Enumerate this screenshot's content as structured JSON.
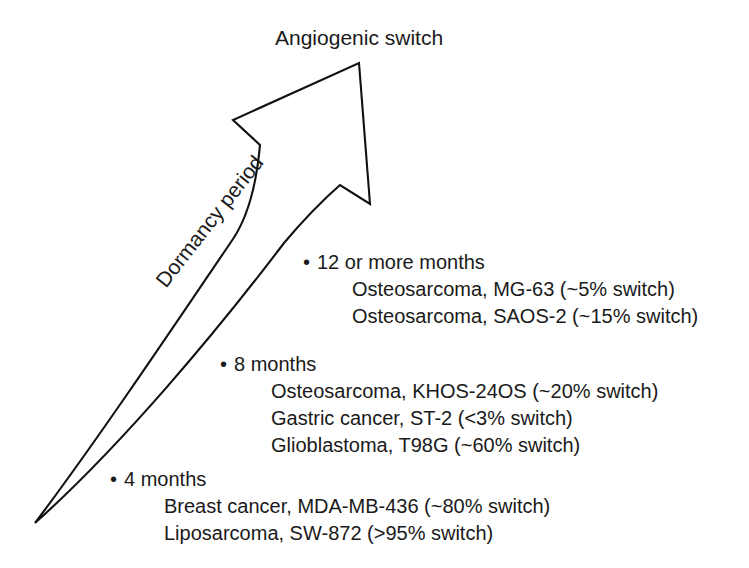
{
  "figure": {
    "title": "Angiogenic switch",
    "axis_label": "Dormancy period",
    "background_color": "#ffffff",
    "line_color": "#111111",
    "text_color": "#1a1a1a"
  },
  "arrow": {
    "name": "upward-arrow",
    "direction": "up-right",
    "tip": [
      359,
      63
    ],
    "tail": [
      35,
      523
    ]
  },
  "groups": [
    {
      "bullet": "•",
      "heading": "12 or more months",
      "entries": [
        "Osteosarcoma, MG-63 (~5% switch)",
        "Osteosarcoma, SAOS-2 (~15% switch)"
      ]
    },
    {
      "bullet": "•",
      "heading": "8 months",
      "entries": [
        "Osteosarcoma, KHOS-24OS (~20% switch)",
        "Gastric cancer, ST-2 (<3% switch)",
        "Glioblastoma, T98G (~60% switch)"
      ]
    },
    {
      "bullet": "•",
      "heading": "4 months",
      "entries": [
        "Breast cancer, MDA-MB-436 (~80% switch)",
        "Liposarcoma, SW-872 (>95% switch)"
      ]
    }
  ]
}
